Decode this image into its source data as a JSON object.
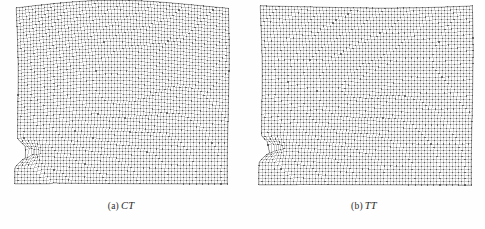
{
  "figure": {
    "type": "finite-element-mesh-comparison",
    "background_color": "#fefefe",
    "mesh_line_color": "#8a8a8a",
    "mesh_node_color": "#3a3a3a",
    "caption_color": "#2b2b2b"
  },
  "panels": [
    {
      "id": "panel-a",
      "label_prefix": "(a)",
      "label_symbol": "CT",
      "full_caption": "(a) CT",
      "mesh": {
        "name": "CT-deformed-mesh",
        "nx": 68,
        "ny": 56,
        "x0": 16,
        "y0": 8,
        "x1": 228,
        "y1": 184,
        "notch": {
          "side": "left",
          "y_frac": 0.83,
          "depth_frac": 0.055,
          "height_frac": 0.075
        },
        "top_wave": {
          "amplitude": 7.5,
          "phase": 0.0,
          "periods": 1.15,
          "right_tilt": -2.0
        },
        "shear_band": {
          "origin_x_frac": 0.03,
          "origin_y_frac": 0.84,
          "angle_deg": 41,
          "intensity": 1.0,
          "width_frac": 0.17
        },
        "deformation": {
          "mode": "compact-tension",
          "max_warp_px": 6.2,
          "bulge_x_frac": 0.38,
          "bulge_y_frac": 0.45
        }
      }
    },
    {
      "id": "panel-b",
      "label_prefix": "(b)",
      "label_symbol": "TT",
      "full_caption": "(b) TT",
      "mesh": {
        "name": "TT-deformed-mesh",
        "nx": 68,
        "ny": 56,
        "x0": 17,
        "y0": 9,
        "x1": 229,
        "y1": 185,
        "notch": {
          "side": "left",
          "y_frac": 0.8,
          "depth_frac": 0.05,
          "height_frac": 0.07
        },
        "top_wave": {
          "amplitude": 3.0,
          "phase": 0.55,
          "periods": 0.85,
          "right_tilt": -5.0
        },
        "shear_band": {
          "origin_x_frac": 0.03,
          "origin_y_frac": 0.81,
          "angle_deg": 38,
          "intensity": 0.78,
          "width_frac": 0.15
        },
        "deformation": {
          "mode": "tapered-tension",
          "max_warp_px": 4.4,
          "bulge_x_frac": 0.3,
          "bulge_y_frac": 0.48
        }
      }
    }
  ]
}
